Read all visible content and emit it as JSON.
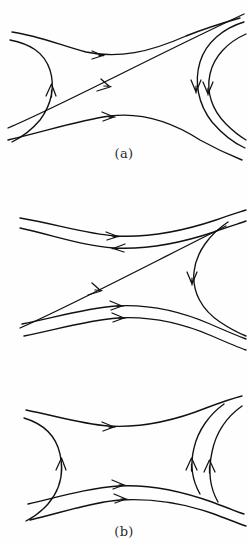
{
  "figure": {
    "background_color": "#ffffff",
    "ink_color": "#111111",
    "width": 248,
    "height": 545,
    "panel_count": 3
  },
  "panels": [
    {
      "id": "a",
      "label": "(a)",
      "description": "Saddle-point flow: incoming streamlines from left and right, single diagonal separatrix running lower-left to upper-right",
      "separatrix": {
        "present": true,
        "orientation": "lower-left-to-upper-right",
        "arrow_direction": "right"
      },
      "streamlines": [
        {
          "name": "top-branch",
          "arrow_direction": "right",
          "arrow_count": 1
        },
        {
          "name": "left-upper-turn",
          "arrow_direction": "up",
          "arrow_count": 1
        },
        {
          "name": "bottom-branch",
          "arrow_direction": "right",
          "arrow_count": 1
        },
        {
          "name": "right-inner-turn",
          "arrow_direction": "down",
          "arrow_count": 1
        },
        {
          "name": "right-outer-turn",
          "arrow_direction": "down",
          "arrow_count": 1
        }
      ],
      "arrow_summary": {
        "right": 2,
        "up": 1,
        "down": 2,
        "left": 0
      }
    },
    {
      "id": "b",
      "label": "(b)",
      "description": "Asymmetric saddle: top pair of streamlines carry opposing arrows, diagonal separatrix to upper right, single right-hand turning streamline",
      "separatrix": {
        "present": true,
        "orientation": "lower-left-to-upper-right",
        "arrow_direction": "right"
      },
      "streamlines": [
        {
          "name": "top-outer",
          "arrow_direction": "right",
          "arrow_count": 1
        },
        {
          "name": "top-inner",
          "arrow_direction": "left",
          "arrow_count": 1
        },
        {
          "name": "bottom-inner",
          "arrow_direction": "right",
          "arrow_count": 1
        },
        {
          "name": "bottom-outer",
          "arrow_direction": "right",
          "arrow_count": 1
        },
        {
          "name": "right-turn",
          "arrow_direction": "down",
          "arrow_count": 1
        }
      ],
      "arrow_summary": {
        "right": 3,
        "up": 0,
        "down": 1,
        "left": 1
      }
    },
    {
      "id": "c",
      "label": "(c)",
      "description": "Saddle without separatrix: left streamline turns upward, right pair of streamlines turn upward, lower pair flow to the right",
      "separatrix": {
        "present": false,
        "orientation": "",
        "arrow_direction": ""
      },
      "streamlines": [
        {
          "name": "top-branch",
          "arrow_direction": "right",
          "arrow_count": 1
        },
        {
          "name": "left-turn",
          "arrow_direction": "up",
          "arrow_count": 1
        },
        {
          "name": "bottom-inner",
          "arrow_direction": "right",
          "arrow_count": 1
        },
        {
          "name": "bottom-outer",
          "arrow_direction": "right",
          "arrow_count": 1
        },
        {
          "name": "right-inner-turn",
          "arrow_direction": "up",
          "arrow_count": 1
        },
        {
          "name": "right-outer-turn",
          "arrow_direction": "up",
          "arrow_count": 1
        }
      ],
      "arrow_summary": {
        "right": 2,
        "up": 3,
        "down": 0,
        "left": 0
      }
    }
  ]
}
